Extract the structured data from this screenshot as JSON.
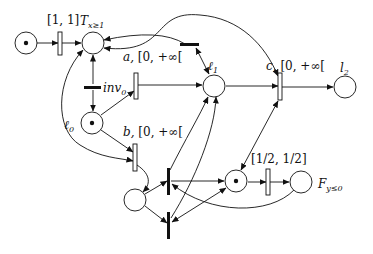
{
  "diagram": {
    "type": "timed petri net",
    "places": [
      {
        "id": "p_init",
        "label": "",
        "token": true
      },
      {
        "id": "T",
        "label": "T",
        "subscript": "x≥1",
        "token": false
      },
      {
        "id": "l0",
        "label": "ℓ",
        "subscript": "0",
        "token": true
      },
      {
        "id": "l1",
        "label": "ℓ",
        "subscript": "1",
        "token": false
      },
      {
        "id": "l2",
        "label": "l",
        "subscript": "2",
        "token": false
      },
      {
        "id": "p_bottom",
        "label": "",
        "token": false
      },
      {
        "id": "p_mid",
        "label": "",
        "token": true
      },
      {
        "id": "F",
        "label": "F",
        "subscript": "y≤0",
        "token": false
      }
    ],
    "transitions": [
      {
        "id": "t_init",
        "label": "[1, 1]"
      },
      {
        "id": "a",
        "label": "a,",
        "interval": "[0, +∞["
      },
      {
        "id": "b",
        "label": "b,",
        "interval": "[0, +∞["
      },
      {
        "id": "c",
        "label": "c,",
        "interval": "[0, +∞["
      },
      {
        "id": "inv0",
        "label": "inv",
        "subscript": "0"
      },
      {
        "id": "t_half",
        "label": "[1/2, 1/2]"
      },
      {
        "id": "t_top_bar",
        "label": ""
      },
      {
        "id": "t_bar_upper",
        "label": ""
      },
      {
        "id": "t_bar_lower",
        "label": ""
      }
    ]
  },
  "labels": {
    "t_init": "[1, 1]",
    "T_main": "T",
    "T_sub": "x≥1",
    "a_name": "a,",
    "a_interval": "[0, +∞[",
    "inv_main": "inv",
    "inv_sub": "0",
    "l0_main": "ℓ",
    "l0_sub": "0",
    "l1_main": "ℓ",
    "l1_sub": "1",
    "b_name": "b,",
    "b_interval": "[0, +∞[",
    "c_name": "c,",
    "c_interval": "[0, +∞[",
    "l2_main": "l",
    "l2_sub": "2",
    "half_interval": "[1/2, 1/2]",
    "F_main": "F",
    "F_sub": "y≤0"
  },
  "colors": {
    "stroke": "#111111",
    "background": "#ffffff"
  }
}
